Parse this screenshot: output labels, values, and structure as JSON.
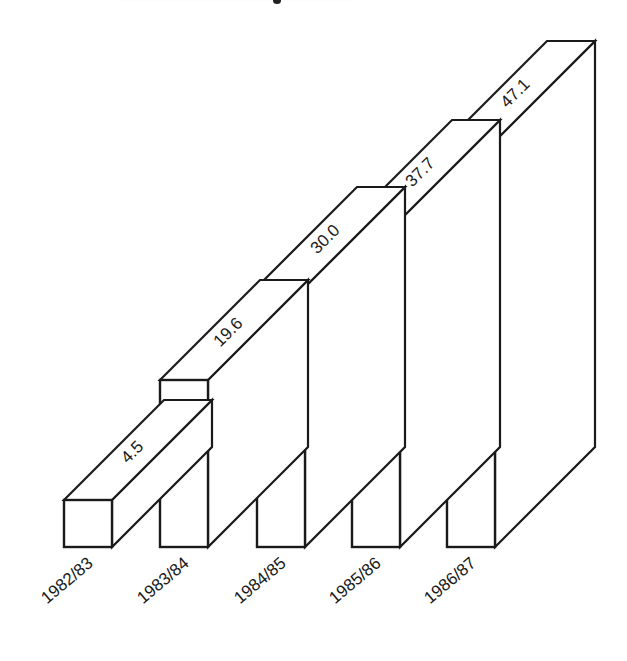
{
  "chart_data": {
    "type": "bar",
    "style": "3d-isometric",
    "title": "",
    "xlabel": "",
    "ylabel": "",
    "categories": [
      "1982/83",
      "1983/84",
      "1984/85",
      "1985/86",
      "1986/87"
    ],
    "values": [
      4.5,
      19.6,
      30.0,
      37.7,
      47.1
    ],
    "value_labels": [
      "4.5",
      "19.6",
      "30.0",
      "37.7",
      "47.1"
    ],
    "ylim": [
      0,
      50
    ],
    "grid": false,
    "legend": null,
    "tick_label_rotation_deg": -40,
    "colors": {
      "fill": "#ffffff",
      "stroke": "#1a1a1a",
      "text": "#1a1a1a"
    }
  },
  "layout": {
    "baseline_y": 547,
    "bar_width": 48,
    "depth_dx": 100,
    "depth_dy": -100,
    "bar_left_x": [
      64,
      160,
      257,
      352,
      447
    ],
    "bar_top_y": [
      500,
      380,
      287,
      220,
      141
    ]
  }
}
